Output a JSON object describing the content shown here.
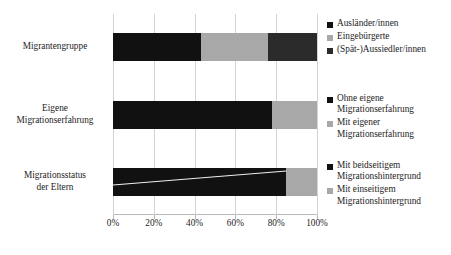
{
  "chart_data": {
    "type": "bar",
    "title": "",
    "subtitle": "",
    "xlabel": "",
    "ylabel": "",
    "orientation": "horizontal",
    "stacked": true,
    "normalized": true,
    "grid": true,
    "legend_position": "right",
    "xlim": [
      0,
      100
    ],
    "xticks": [
      "0%",
      "20%",
      "40%",
      "60%",
      "80%",
      "100%"
    ],
    "xtick_values": [
      0,
      20,
      40,
      60,
      80,
      100
    ],
    "categories": [
      "Migrantengruppe",
      "Eigene Migrationserfahrung",
      "Migrationsstatus der Eltern"
    ],
    "groups": [
      {
        "category": "Migrantengruppe",
        "segments": [
          {
            "label": "Ausländer/innen",
            "value": 43,
            "color": "#111111"
          },
          {
            "label": "Eingebürgerte",
            "value": 33,
            "color": "#a8a8a8"
          },
          {
            "label": "(Spät-)Aussiedler/innen",
            "value": 24,
            "color": "#2b2b2b"
          }
        ]
      },
      {
        "category": "Eigene Migrationserfahrung",
        "segments": [
          {
            "label": "Ohne eigene Migrationserfahrung",
            "value": 78,
            "color": "#111111"
          },
          {
            "label": "Mit eigener Migrationserfahrung",
            "value": 22,
            "color": "#a8a8a8"
          }
        ]
      },
      {
        "category": "Migrationsstatus der Eltern",
        "segments": [
          {
            "label": "Mit beidseitigem Migrationshintergrund",
            "value": 85,
            "color": "#111111"
          },
          {
            "label": "Mit einseitigem Migrationshintergrund",
            "value": 15,
            "color": "#a8a8a8"
          }
        ]
      }
    ]
  },
  "categories": {
    "migrantengruppe": "Migrantengruppe",
    "eigene_erfahrung_line1": "Eigene",
    "eigene_erfahrung_line2": "Migrationserfahrung",
    "eltern_line1": "Migrationsstatus",
    "eltern_line2": "der Eltern"
  },
  "axis": {
    "tick_0": "0%",
    "tick_20": "20%",
    "tick_40": "40%",
    "tick_60": "60%",
    "tick_80": "80%",
    "tick_100": "100%"
  },
  "legend": {
    "group1": [
      {
        "label": "Ausländer/innen",
        "color": "#111111"
      },
      {
        "label": "Eingebürgerte",
        "color": "#a8a8a8"
      },
      {
        "label": "(Spät-)Aussiedler/innen",
        "color": "#2b2b2b"
      }
    ],
    "group2": [
      {
        "label_line1": "Ohne eigene",
        "label_line2": "Migrationserfahrung",
        "color": "#111111"
      },
      {
        "label_line1": "Mit eigener",
        "label_line2": "Migrationserfahrung",
        "color": "#a8a8a8"
      }
    ],
    "group3": [
      {
        "label_line1": "Mit beidseitigem",
        "label_line2": "Migrationshintergrund",
        "color": "#111111"
      },
      {
        "label_line1": "Mit einseitigem",
        "label_line2": "Migrationshintergrund",
        "color": "#a8a8a8"
      }
    ]
  },
  "colors": {
    "dark": "#111111",
    "gray": "#a8a8a8",
    "darkgray": "#2b2b2b",
    "gridline": "#d2d2d2",
    "axis": "#b9b9b9",
    "background": "#ffffff",
    "text": "#1d1d1d"
  }
}
